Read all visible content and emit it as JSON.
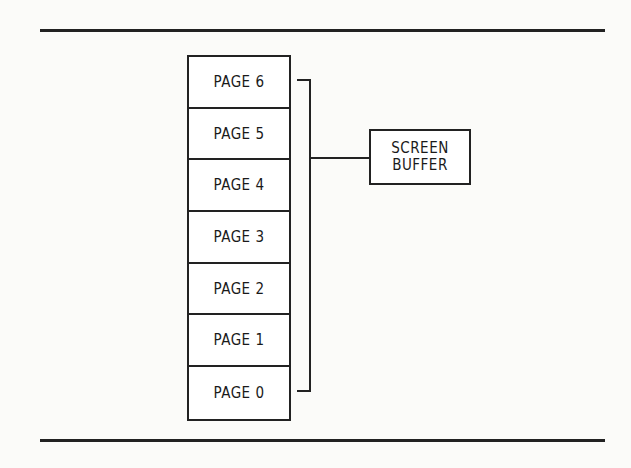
{
  "diagram": {
    "pages": [
      "PAGE 6",
      "PAGE 5",
      "PAGE 4",
      "PAGE 3",
      "PAGE 2",
      "PAGE 1",
      "PAGE 0"
    ],
    "target": {
      "line1": "SCREEN",
      "line2": "BUFFER"
    }
  }
}
